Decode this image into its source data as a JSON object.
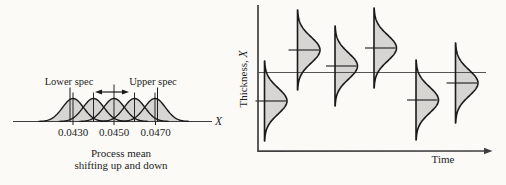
{
  "figure": {
    "bg": "#fbfaf7",
    "ink": "#1a1a1a",
    "fill_gray": "#d6d5d1",
    "axis_gray": "#3f3f3f",
    "ref_line_gray": "#555555"
  },
  "chart_data": [
    {
      "id": "process-mean-shift",
      "type": "area",
      "description": "Five overlapping normal distributions of dimension X; process mean shifts up and down between the specification limits",
      "xlabel": "X",
      "lower_spec_label": "Lower spec",
      "upper_spec_label": "Upper spec",
      "caption_line1": "Process mean",
      "caption_line2": "shifting up and down",
      "distribution_means": [
        0.043,
        0.044,
        0.045,
        0.046,
        0.047
      ],
      "distribution_sigma": 0.0005,
      "lower_spec": 0.043,
      "upper_spec": 0.047,
      "ticks": [
        {
          "label": "0.0430",
          "value": 0.043,
          "x_px": 73
        },
        {
          "label": "0.0450",
          "value": 0.045,
          "x_px": 114
        },
        {
          "label": "0.0470",
          "value": 0.047,
          "x_px": 155.5
        }
      ],
      "layout": {
        "axis_y": 121.5,
        "axis_x1": 13,
        "axis_x2": 212,
        "x_label_x": 215,
        "x_label_y": 125,
        "means_px": [
          73,
          93.5,
          114,
          134.5,
          155
        ],
        "sigma_px": 10.5,
        "peak_px": 23,
        "mean_line_top": 92.5,
        "center_line_top": 84.5,
        "spec_x_px": [
          70,
          157.5
        ],
        "spec_line_top": 87.5,
        "spec_label_y": 84.5,
        "lower_label_x": 69,
        "upper_label_x": 153,
        "tick_label_y": 136,
        "tick_len": 3.5,
        "caption_x": 121,
        "caption_y1": 156.5,
        "caption_y2": 168.5,
        "arrow": {
          "y": 92,
          "x1": 95,
          "x2": 129,
          "cross_x": 114
        }
      }
    },
    {
      "id": "thickness-over-time",
      "type": "area",
      "description": "Sideways normal distributions of part thickness at successive times; the process mean wanders about the nominal (horizontal) line",
      "ylabel_prefix": "Thickness, ",
      "ylabel_var": "X",
      "xlabel": "Time",
      "offsets_from_nominal_px": [
        -28.5,
        22.5,
        6.5,
        24.5,
        -27.5,
        -10.5
      ],
      "layout": {
        "y_axis": {
          "x": 258,
          "y1": 5,
          "y2": 152
        },
        "x_axis": {
          "y": 151,
          "x1": 258,
          "x2": 485,
          "tip_x": 492.5
        },
        "nominal_y": 72.5,
        "nominal_x1": 258,
        "nominal_x2": 486,
        "spines_x": [
          264.5,
          297.5,
          335,
          374,
          416,
          455.5
        ],
        "means_y": [
          101,
          50,
          66,
          48,
          100,
          83
        ],
        "sigma_px": 13,
        "bulge_px": 22.5,
        "half_len": 40,
        "mean_line_left": 9,
        "mean_line_right": 21.5,
        "ylabel_x": 246.5,
        "ylabel_y": 79,
        "xlabel_x": 443,
        "xlabel_y": 163
      }
    }
  ]
}
